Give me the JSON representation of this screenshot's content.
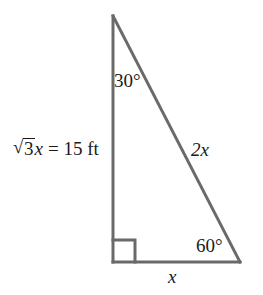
{
  "figure": {
    "type": "geometry-diagram",
    "shape": "right-triangle",
    "background_color": "#ffffff",
    "stroke_color": "#6a6a6a",
    "text_color": "#1a1a1a",
    "stroke_width": 3
  },
  "labels": {
    "angle_top": "30°",
    "angle_bottom_right": "60°",
    "side_left_radical_sign": "√",
    "side_left_radicand": "3",
    "side_left_variable": "x",
    "side_left_equals": "= 15 ft",
    "side_hypotenuse": "2x",
    "side_bottom": "x"
  },
  "geometry": {
    "apex": {
      "x": 113,
      "y": 16
    },
    "right_angle_vertex": {
      "x": 113,
      "y": 262
    },
    "bottom_right_vertex": {
      "x": 240,
      "y": 262
    },
    "right_angle_marker_size": 22
  }
}
